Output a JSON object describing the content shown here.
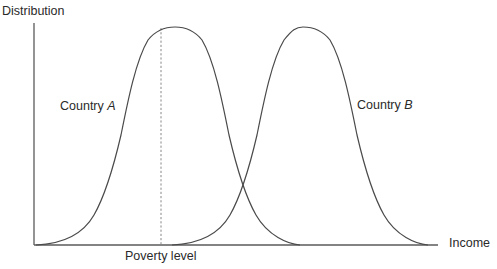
{
  "diagram": {
    "type": "distribution-comparison",
    "axes": {
      "y_label": "Distribution",
      "x_label": "Income"
    },
    "markers": {
      "poverty_line_label": "Poverty level"
    },
    "series": [
      {
        "name_prefix": "Country ",
        "name_letter": "A",
        "shape": "bell-curve",
        "relative_position": "left"
      },
      {
        "name_prefix": "Country ",
        "name_letter": "B",
        "shape": "bell-curve",
        "relative_position": "right"
      }
    ],
    "colors": {
      "curve": "#4a4a4a",
      "axis": "#5a5a5a",
      "dashed_line": "#888888",
      "text": "#2a2a2a"
    }
  }
}
